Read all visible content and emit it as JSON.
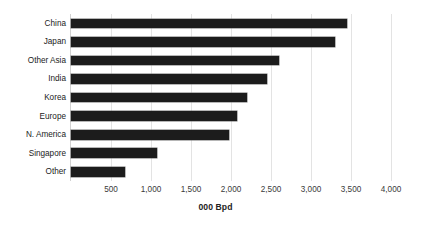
{
  "chart_data": {
    "type": "bar",
    "orientation": "horizontal",
    "title": "",
    "xlabel": "000 Bpd",
    "ylabel": "",
    "categories": [
      "China",
      "Japan",
      "Other Asia",
      "India",
      "Korea",
      "Europe",
      "N. America",
      "Singapore",
      "Other"
    ],
    "values": [
      3450,
      3300,
      2600,
      2450,
      2200,
      2080,
      1970,
      1080,
      680
    ],
    "xlim": [
      0,
      4000
    ],
    "xticks": [
      500,
      1000,
      1500,
      2000,
      2500,
      3000,
      3500,
      4000
    ],
    "xtick_labels": [
      "500",
      "1,000",
      "1,500",
      "2,000",
      "2,500",
      "3,000",
      "3,500",
      "4,000"
    ],
    "grid": true,
    "grid_axis": "x",
    "legend": false,
    "bar_color": "#1c1c1c",
    "grid_color": "#e3e3e3",
    "axis_color": "#d2d2d2",
    "text_color": "#222222"
  }
}
